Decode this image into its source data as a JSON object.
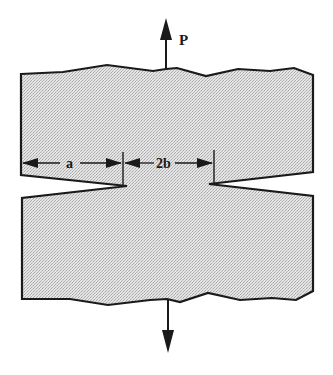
{
  "diagram": {
    "labels": {
      "load": "P",
      "notch_depth": "a",
      "ligament_width": "2b"
    },
    "colors": {
      "fill": "#d6d6d6",
      "stroke": "#1a1a1a",
      "background": "#ffffff"
    }
  }
}
